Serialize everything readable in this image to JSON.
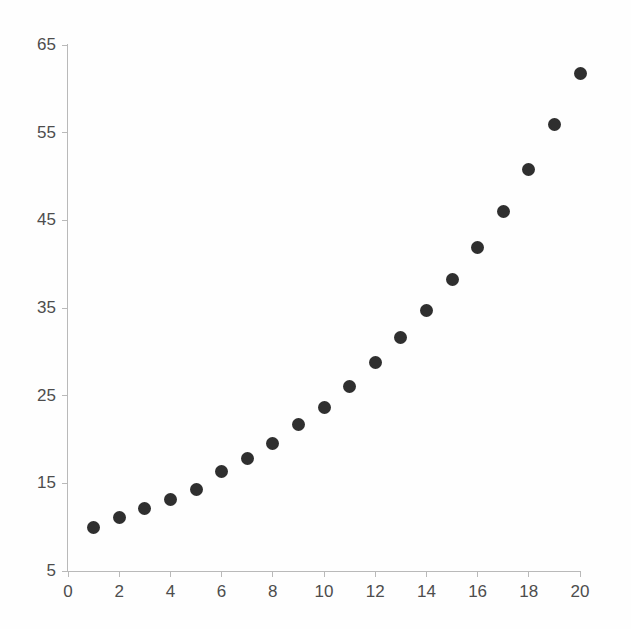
{
  "chart_data": {
    "type": "scatter",
    "title": "",
    "subtitle": "",
    "xlabel": "",
    "ylabel": "",
    "grid": false,
    "legend": null,
    "legend_position": "none",
    "marker": {
      "shape": "circle",
      "color": "#2f2f2f",
      "size_px": 13
    },
    "background_color": "#fefefe",
    "axis_color": "#b9b9b9",
    "tick_label_color": "#4d4d4d",
    "xlim": [
      0,
      20
    ],
    "ylim": [
      5,
      65
    ],
    "xticks": [
      0,
      2,
      4,
      6,
      8,
      10,
      12,
      14,
      16,
      18,
      20
    ],
    "xtick_labels": [
      "0",
      "2",
      "4",
      "6",
      "8",
      "10",
      "12",
      "14",
      "16",
      "18",
      "20"
    ],
    "yticks": [
      5,
      15,
      25,
      35,
      45,
      55,
      65
    ],
    "ytick_labels": [
      "5",
      "15",
      "25",
      "35",
      "45",
      "55",
      "65"
    ],
    "x": [
      1,
      2,
      3,
      4,
      5,
      6,
      7,
      8,
      9,
      10,
      11,
      12,
      13,
      14,
      15,
      16,
      17,
      18,
      19,
      20
    ],
    "y": [
      10.0,
      11.1,
      12.1,
      13.2,
      14.3,
      16.4,
      17.8,
      19.6,
      21.7,
      23.7,
      26.1,
      28.8,
      31.6,
      34.7,
      38.3,
      41.9,
      46.0,
      50.8,
      55.9,
      61.8
    ],
    "points": [
      {
        "x": 1,
        "y": 10.0
      },
      {
        "x": 2,
        "y": 11.1
      },
      {
        "x": 3,
        "y": 12.1
      },
      {
        "x": 4,
        "y": 13.2
      },
      {
        "x": 5,
        "y": 14.3
      },
      {
        "x": 6,
        "y": 16.4
      },
      {
        "x": 7,
        "y": 17.8
      },
      {
        "x": 8,
        "y": 19.6
      },
      {
        "x": 9,
        "y": 21.7
      },
      {
        "x": 10,
        "y": 23.7
      },
      {
        "x": 11,
        "y": 26.1
      },
      {
        "x": 12,
        "y": 28.8
      },
      {
        "x": 13,
        "y": 31.6
      },
      {
        "x": 14,
        "y": 34.7
      },
      {
        "x": 15,
        "y": 38.3
      },
      {
        "x": 16,
        "y": 41.9
      },
      {
        "x": 17,
        "y": 46.0
      },
      {
        "x": 18,
        "y": 50.8
      },
      {
        "x": 19,
        "y": 55.9
      },
      {
        "x": 20,
        "y": 61.8
      }
    ]
  }
}
